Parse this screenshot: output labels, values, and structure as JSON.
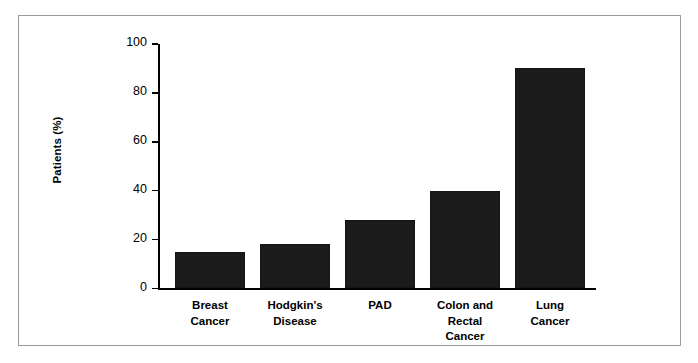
{
  "chart_data": {
    "type": "bar",
    "title": "",
    "subtitle": "",
    "xlabel": "",
    "ylabel": "Patients (%)",
    "ylim": [
      0,
      100
    ],
    "ytick_labels": [
      "0",
      "20",
      "40",
      "60",
      "80",
      "100"
    ],
    "ytick_values": [
      0,
      20,
      40,
      60,
      80,
      100
    ],
    "grid": false,
    "legend": null,
    "bar_color": "#1b1b1b",
    "categories": [
      "Breast\nCancer",
      "Hodgkin's\nDisease",
      "PAD",
      "Colon and\nRectal\nCancer",
      "Lung\nCancer"
    ],
    "values": [
      15,
      18,
      28,
      40,
      90
    ],
    "series": [
      {
        "name": "Patients (%)",
        "values": [
          15,
          18,
          28,
          40,
          90
        ]
      }
    ]
  },
  "figure": {
    "border_color": "#9b9b9b",
    "background": "#ffffff"
  }
}
